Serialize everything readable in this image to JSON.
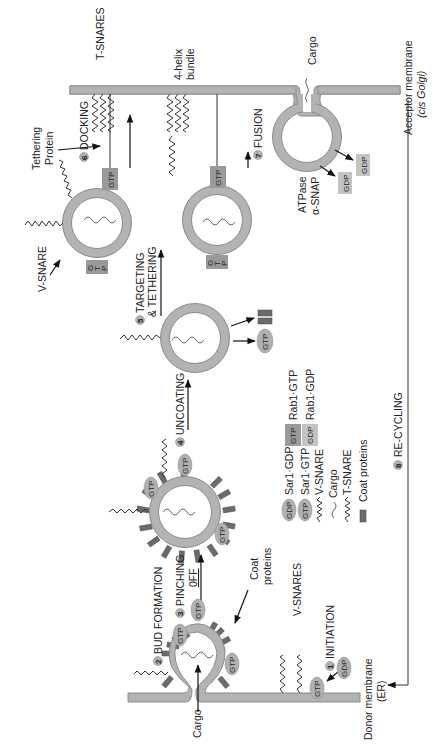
{
  "diagram": {
    "orientation": "labels rotated -90deg (read bottom-to-top)",
    "steps": [
      {
        "num": "1",
        "label": "INITIATION"
      },
      {
        "num": "2",
        "label": "BUD FORMATION"
      },
      {
        "num": "3",
        "label": "PINCHING",
        "label2": "0FF"
      },
      {
        "num": "4",
        "label": "UNCOATING"
      },
      {
        "num": "5",
        "label": "TARGETING",
        "label2": "& TETHERING"
      },
      {
        "num": "6",
        "label": "DOCKING"
      },
      {
        "num": "7",
        "label": "FUSION"
      },
      {
        "num": "8",
        "label": "RE-CYCLING"
      }
    ],
    "labels": {
      "donor_membrane": "Donor membrane",
      "donor_membrane_sub": "(ER)",
      "acceptor_membrane": "Acceptor membrane",
      "acceptor_membrane_sub": "(cis Golgi)",
      "cargo_bottom": "Cargo",
      "cargo_top": "Cargo",
      "coat_proteins_1": "Coat",
      "coat_proteins_2": "proteins",
      "v_snares": "V-SNARES",
      "v_snare": "V-SNARE",
      "t_snares": "T-SNARES",
      "helix_1": "4-helix",
      "helix_2": "bundle",
      "tethering_1": "Tethering",
      "tethering_2": "Protein",
      "atpase": "ATPase",
      "alpha_snap": "α-SNAP"
    },
    "chips": {
      "gtp": "GTP",
      "gdp": "GDP",
      "g": "G",
      "t": "T",
      "p": "P"
    },
    "legend": [
      {
        "icon": "GDP",
        "icon_style": "pill",
        "label": "Sar1·GDP"
      },
      {
        "icon": "GTP",
        "icon_style": "pill",
        "label": "Sar1·GTP"
      },
      {
        "icon": "zigzag",
        "label": "V-SNARE"
      },
      {
        "icon": "wave",
        "label": "Cargo"
      },
      {
        "icon": "zigzag",
        "label": "T-SNARE"
      },
      {
        "icon": "bar",
        "label": "Coat proteins"
      }
    ],
    "legend_rab": [
      {
        "icon": "GTP",
        "icon_style": "box-dark",
        "label": "Rab1·GTP"
      },
      {
        "icon": "GDP",
        "icon_style": "box-light",
        "label": "Rab1·GDP"
      }
    ],
    "colors": {
      "membrane": "#b3b3b3",
      "coat": "#6b6b6b",
      "pill": "#b0b0b0",
      "box_dark": "#9a9a9a",
      "box_light": "#c4c4c4",
      "text": "#222222"
    }
  }
}
